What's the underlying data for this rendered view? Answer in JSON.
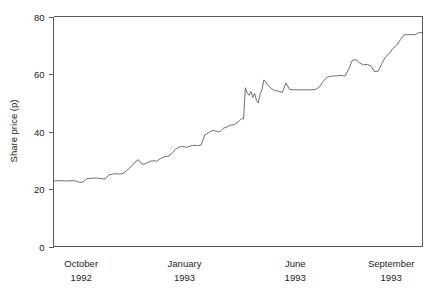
{
  "chart_data": {
    "type": "line",
    "title": "",
    "xlabel": "",
    "ylabel": "Share price (p)",
    "ylim": [
      0,
      80
    ],
    "yticks": [
      0,
      20,
      40,
      60,
      80
    ],
    "ytick_labels": [
      "0",
      "20",
      "40",
      "60",
      "80"
    ],
    "grid": false,
    "legend": null,
    "xtick_labels": [
      {
        "month": "October",
        "year": "1992"
      },
      {
        "month": "January",
        "year": "1993"
      },
      {
        "month": "June",
        "year": "1993"
      },
      {
        "month": "September",
        "year": "1993"
      }
    ],
    "xtick_positions_frac": [
      0.075,
      0.355,
      0.655,
      0.915
    ],
    "x_label_text": [
      "October 1992",
      "January 1993",
      "June 1993",
      "September 1993"
    ],
    "series": [
      {
        "name": "Share price",
        "x": [
          0.0,
          0.01,
          0.02,
          0.03,
          0.04,
          0.05,
          0.06,
          0.07,
          0.08,
          0.09,
          0.1,
          0.11,
          0.12,
          0.13,
          0.14,
          0.15,
          0.16,
          0.17,
          0.18,
          0.19,
          0.2,
          0.21,
          0.22,
          0.23,
          0.24,
          0.25,
          0.26,
          0.27,
          0.28,
          0.29,
          0.3,
          0.31,
          0.32,
          0.33,
          0.34,
          0.35,
          0.36,
          0.37,
          0.38,
          0.39,
          0.4,
          0.41,
          0.42,
          0.43,
          0.44,
          0.45,
          0.46,
          0.47,
          0.48,
          0.49,
          0.5,
          0.505,
          0.51,
          0.515,
          0.52,
          0.525,
          0.53,
          0.535,
          0.54,
          0.545,
          0.55,
          0.555,
          0.56,
          0.565,
          0.57,
          0.575,
          0.58,
          0.59,
          0.6,
          0.61,
          0.62,
          0.63,
          0.64,
          0.65,
          0.66,
          0.67,
          0.68,
          0.69,
          0.7,
          0.71,
          0.72,
          0.73,
          0.74,
          0.75,
          0.76,
          0.77,
          0.78,
          0.79,
          0.8,
          0.81,
          0.82,
          0.83,
          0.84,
          0.85,
          0.86,
          0.87,
          0.88,
          0.89,
          0.9,
          0.91,
          0.92,
          0.93,
          0.94,
          0.95,
          0.96,
          0.97,
          0.98,
          0.99,
          1.0
        ],
        "values": [
          22.8,
          22.9,
          22.9,
          22.8,
          22.8,
          22.9,
          22.8,
          22.3,
          22.4,
          23.6,
          23.7,
          23.8,
          23.8,
          23.6,
          23.5,
          24.9,
          25.2,
          25.3,
          25.2,
          25.5,
          26.6,
          27.8,
          29.3,
          30.2,
          28.6,
          28.8,
          29.6,
          29.8,
          29.7,
          30.6,
          31.2,
          31.4,
          32.2,
          33.7,
          34.6,
          34.8,
          34.5,
          34.9,
          35.2,
          35.1,
          35.3,
          38.8,
          39.6,
          40.3,
          40.2,
          39.8,
          41.1,
          41.6,
          42.2,
          42.4,
          43.3,
          43.9,
          44.5,
          44.3,
          55.2,
          53.4,
          52.6,
          53.9,
          51.8,
          53.3,
          50.9,
          49.9,
          53.1,
          54.5,
          57.9,
          57.4,
          56.2,
          55.0,
          54.2,
          54.0,
          53.6,
          56.9,
          54.6,
          54.5,
          54.5,
          54.5,
          54.5,
          54.5,
          54.5,
          54.6,
          55.4,
          57.3,
          58.8,
          59.2,
          59.3,
          59.4,
          59.5,
          59.3,
          61.7,
          64.8,
          65.0,
          63.8,
          63.2,
          63.3,
          62.9,
          60.8,
          61.0,
          63.7,
          66.0,
          67.1,
          68.9,
          70.0,
          71.9,
          73.6,
          73.7,
          73.7,
          73.7,
          74.4,
          74.4
        ]
      }
    ]
  },
  "labels": {
    "y_axis_title": "Share price (p)"
  }
}
